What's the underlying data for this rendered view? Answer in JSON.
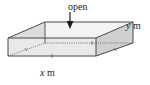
{
  "figure": {
    "type": "3d-open-top-rectangular-box-diagram",
    "labels": {
      "open": {
        "text": "open",
        "arrow": "down-arrow-pointing-into-open-top"
      },
      "depth": {
        "variable": "y",
        "unit": "m",
        "full": "y m"
      },
      "width": {
        "variable": "x",
        "unit": "m",
        "full": "x m"
      }
    },
    "colors": {
      "front_face": "#e8e8e8",
      "right_face": "#d2d2d2",
      "left_inner_face": "#dedede",
      "back_inner_face": "#f2f2f2",
      "top_rim": "#cfcfcf",
      "outline": "#4a4a4a",
      "hidden_edge": "#6b6b6b",
      "text": "#1a1a1a",
      "background": "#ffffff"
    },
    "geometry": {
      "front_bottom_left": [
        8,
        56
      ],
      "front_bottom_right": [
        96,
        56
      ],
      "front_top_left": [
        8,
        38
      ],
      "front_top_right": [
        96,
        38
      ],
      "back_bottom_left": [
        45,
        43
      ],
      "back_bottom_right": [
        133,
        43
      ],
      "back_top_left": [
        45,
        22
      ],
      "back_top_right": [
        133,
        22
      ],
      "rim_inner_left": [
        45,
        22
      ],
      "rim_inner_right": [
        133,
        22
      ]
    }
  }
}
